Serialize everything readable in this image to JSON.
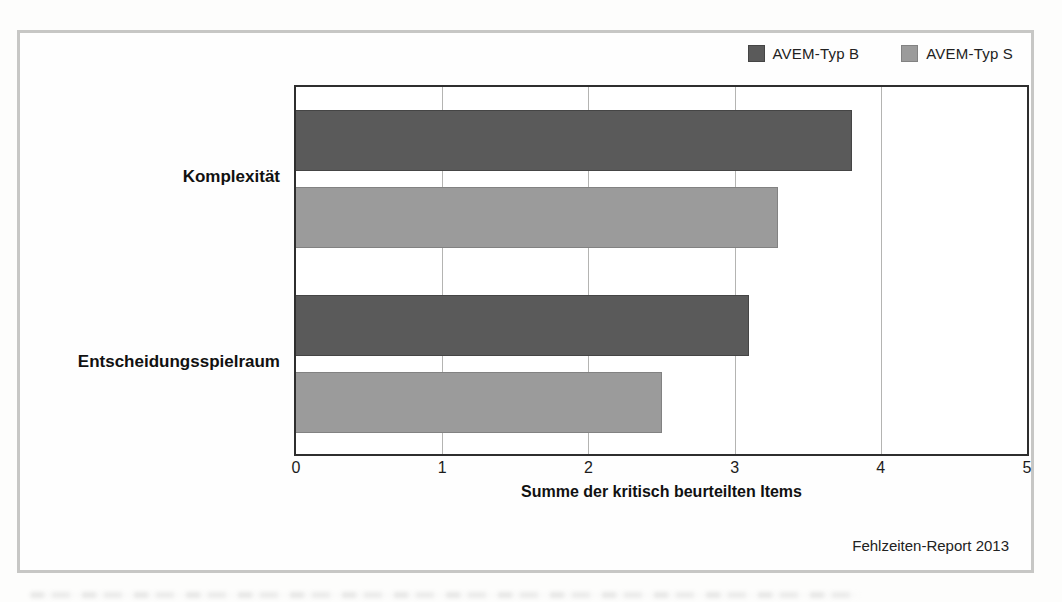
{
  "chart_data": {
    "type": "bar",
    "orientation": "horizontal",
    "categories": [
      "Komplexität",
      "Entscheidungsspielraum"
    ],
    "series": [
      {
        "name": "AVEM-Typ B",
        "values": [
          3.8,
          3.1
        ],
        "fill": "#5a5a5a",
        "border": "#454545"
      },
      {
        "name": "AVEM-Typ S",
        "values": [
          3.3,
          2.5
        ],
        "fill": "#9b9b9b",
        "border": "#828282"
      }
    ],
    "title": "",
    "xlabel": "Summe der kritisch beurteilten Items",
    "ylabel": "",
    "xlim": [
      0,
      5
    ],
    "xticks": [
      0,
      1,
      2,
      3,
      4,
      5
    ],
    "grid": "vertical",
    "legend_position": "top-right",
    "source": "Fehlzeiten-Report 2013"
  },
  "frame": {
    "border_color": "#c7c7c5",
    "plot_border_color": "#2e2e2e",
    "gridline_color": "#b4b4b2"
  }
}
